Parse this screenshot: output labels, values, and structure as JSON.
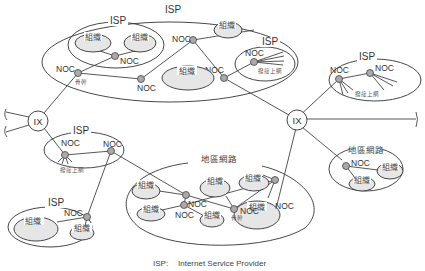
{
  "diagram": {
    "type": "network-topology",
    "labels": {
      "isp": "ISP",
      "noc": "NOC",
      "ix": "IX",
      "org": "組織",
      "backbone": "骨幹",
      "dialup": "撥接上網",
      "regional": "地區網路"
    },
    "legend": {
      "abbr": "ISP:",
      "text": "Internet Service Provider"
    },
    "colors": {
      "line": "#444444",
      "node_fill": "#aaaaaa",
      "org_fill": "#e6e6e6",
      "background": "#ffffff"
    },
    "nodes": {
      "ix": [
        "IX (left)",
        "IX (right)"
      ],
      "groups": [
        "ISP (large top, containing nested ISP with 2 組織, NOC 骨幹, NOCs, 組織, ISP with 撥接上網)",
        "ISP (top right, 2 NOC, 撥接上網)",
        "ISP (left middle, 2 NOC, 撥接上網)",
        "ISP (bottom left, NOC, 2 組織)",
        "地區網路 (bottom center, NOCs, 骨幹, 6 組織)",
        "地區網路 (right, NOC, 2 組織)"
      ]
    }
  }
}
